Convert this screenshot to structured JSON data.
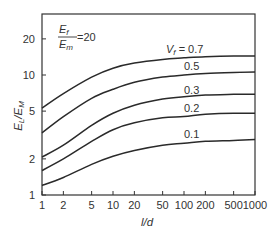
{
  "chart_data": {
    "type": "line",
    "title": "",
    "xlabel": "l/d",
    "ylabel": "E_L/E_M",
    "xscale": "log",
    "yscale": "log",
    "xlim": [
      1,
      1000
    ],
    "ylim": [
      1,
      28
    ],
    "grid": false,
    "legend": "inline curve labels",
    "x_ticks": [
      1,
      2,
      5,
      10,
      20,
      50,
      100,
      200,
      500,
      1000
    ],
    "x_tick_labels": [
      "1",
      "2",
      "5",
      "10",
      "20",
      "50",
      "100",
      "200",
      "500",
      "1000"
    ],
    "y_ticks": [
      1,
      2,
      5,
      10,
      20
    ],
    "y_tick_labels": [
      "1",
      "2",
      "5",
      "10",
      "20"
    ],
    "annotation": {
      "numerator": "E_f",
      "denominator": "E_m",
      "value": "=20"
    },
    "x": [
      1,
      2,
      5,
      10,
      20,
      50,
      100,
      200,
      500,
      1000
    ],
    "series": [
      {
        "name": "V_f = 0.7",
        "label": "V_f = 0.7",
        "values": [
          5.3,
          7.0,
          9.6,
          11.4,
          12.6,
          13.5,
          13.9,
          14.2,
          14.4,
          14.4
        ]
      },
      {
        "name": "0.5",
        "label": "0.5",
        "values": [
          3.3,
          4.5,
          6.4,
          7.6,
          8.7,
          9.6,
          10.0,
          10.3,
          10.5,
          10.6
        ]
      },
      {
        "name": "0.3",
        "label": "0.3",
        "values": [
          2.07,
          2.6,
          3.8,
          4.8,
          5.6,
          6.3,
          6.6,
          6.8,
          6.9,
          6.9
        ]
      },
      {
        "name": "0.2",
        "label": "0.2",
        "values": [
          1.6,
          2.0,
          2.8,
          3.5,
          4.0,
          4.4,
          4.5,
          4.7,
          4.8,
          4.8
        ]
      },
      {
        "name": "0.1",
        "label": "0.1",
        "values": [
          1.2,
          1.4,
          1.8,
          2.1,
          2.35,
          2.6,
          2.7,
          2.8,
          2.85,
          2.9
        ]
      }
    ]
  },
  "labels": {
    "xlabel": "l/d",
    "ylabel_main": "E",
    "ylabel_sub1": "L",
    "ylabel_mid": "/E",
    "ylabel_sub2": "M",
    "anno_num": "E",
    "anno_num_sub": "f",
    "anno_den": "E",
    "anno_den_sub": "m",
    "anno_value": "=20",
    "vf_prefix": "V",
    "vf_sub": "f",
    "vf_eq": " = 0.7",
    "s0": "0.5",
    "s1": "0.3",
    "s2": "0.2",
    "s3": "0.1"
  }
}
